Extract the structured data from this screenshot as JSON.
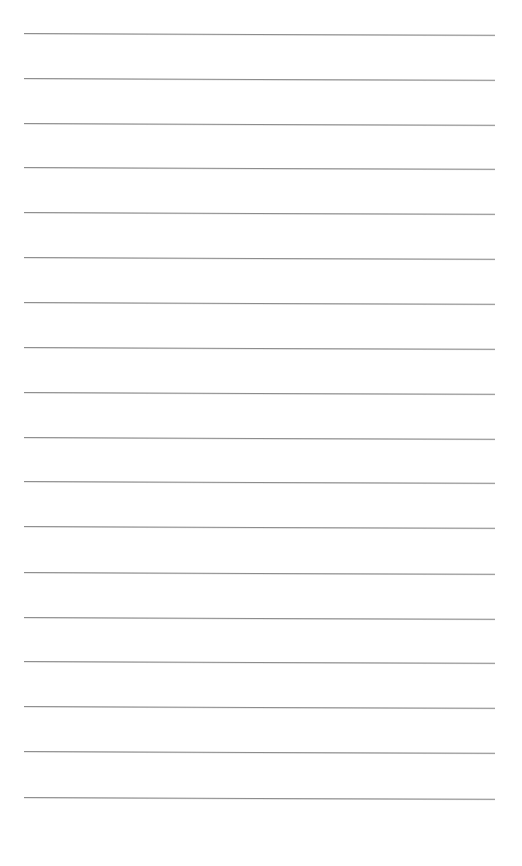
{
  "page": {
    "type": "lined-paper",
    "background_color": "#ffffff",
    "line_color": "#8c8c8c",
    "line_count": 18,
    "line_left_px": 24,
    "line_right_px": 495,
    "line_positions_y": [
      33,
      78,
      123,
      167,
      212,
      257,
      302,
      347,
      392,
      437,
      481,
      526,
      572,
      617,
      661,
      706,
      751,
      797
    ]
  }
}
